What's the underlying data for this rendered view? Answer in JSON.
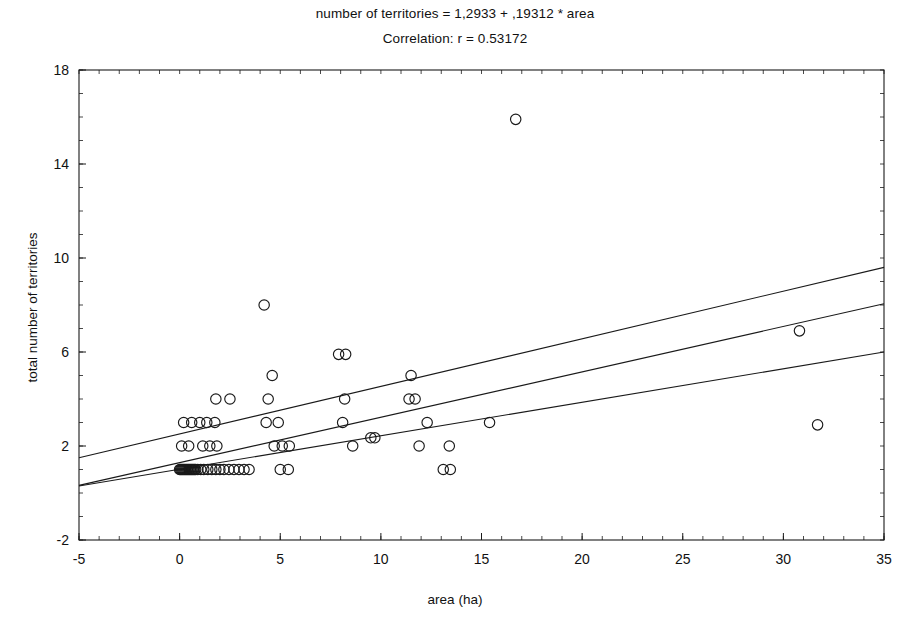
{
  "figure": {
    "title_equation": "number of territories = 1,2933 + ,19312 * area",
    "title_correlation": "Correlation: r = 0.53172",
    "xlabel": "area (ha)",
    "ylabel": "total number of territories",
    "background": "#ffffff",
    "ink_color": "#1a1a1a"
  },
  "chart_data": {
    "type": "scatter",
    "title": "number of territories = 1,2933 + ,19312 * area",
    "subtitle": "Correlation: r = 0.53172",
    "xlabel": "area (ha)",
    "ylabel": "total number of territories",
    "xlim": [
      -5,
      35
    ],
    "ylim": [
      -2,
      18
    ],
    "xticks": [
      -5,
      0,
      5,
      10,
      15,
      20,
      25,
      30,
      35
    ],
    "xticklabels": [
      "-5",
      "0",
      "5",
      "10",
      "15",
      "20",
      "25",
      "30",
      "35"
    ],
    "yticks": [
      -2,
      2,
      6,
      10,
      14,
      18
    ],
    "yticklabels": [
      "-2",
      "2",
      "6",
      "10",
      "14",
      "18"
    ],
    "x_minor_tick_step": 1,
    "y_minor_tick_step": 1,
    "grid": false,
    "legend": null,
    "marker": "open-circle",
    "regression": {
      "intercept": 1.2933,
      "slope": 0.19312,
      "r": 0.53172,
      "line_endpoints": [
        [
          -5,
          0.327
        ],
        [
          35,
          8.053
        ]
      ]
    },
    "confidence_bands": {
      "upper_endpoints": [
        [
          -5,
          1.5
        ],
        [
          35,
          9.6
        ]
      ],
      "lower_endpoints": [
        [
          -5,
          0.3
        ],
        [
          35,
          6.0
        ]
      ]
    },
    "points": [
      [
        0.05,
        1.0
      ],
      [
        0.15,
        1.0
      ],
      [
        0.25,
        1.0
      ],
      [
        0.35,
        1.0
      ],
      [
        0.45,
        1.0
      ],
      [
        0.6,
        1.0
      ],
      [
        0.75,
        1.0
      ],
      [
        0.9,
        1.0
      ],
      [
        1.05,
        1.0
      ],
      [
        1.2,
        1.0
      ],
      [
        1.4,
        1.0
      ],
      [
        1.6,
        1.0
      ],
      [
        1.8,
        1.0
      ],
      [
        2.0,
        1.0
      ],
      [
        2.2,
        1.0
      ],
      [
        2.45,
        1.0
      ],
      [
        2.7,
        1.0
      ],
      [
        2.95,
        1.0
      ],
      [
        3.2,
        1.0
      ],
      [
        3.45,
        1.0
      ],
      [
        0.0,
        1.0
      ],
      [
        0.1,
        1.0
      ],
      [
        0.2,
        1.0
      ],
      [
        0.3,
        1.0
      ],
      [
        0.4,
        1.0
      ],
      [
        0.5,
        1.0
      ],
      [
        0.55,
        1.0
      ],
      [
        0.65,
        1.0
      ],
      [
        0.7,
        1.0
      ],
      [
        0.8,
        1.0
      ],
      [
        5.0,
        1.0
      ],
      [
        5.4,
        1.0
      ],
      [
        0.1,
        2.0
      ],
      [
        0.45,
        2.0
      ],
      [
        1.15,
        2.0
      ],
      [
        1.5,
        2.0
      ],
      [
        1.85,
        2.0
      ],
      [
        4.7,
        2.0
      ],
      [
        5.1,
        2.0
      ],
      [
        5.45,
        2.0
      ],
      [
        8.6,
        2.0
      ],
      [
        9.5,
        2.35
      ],
      [
        9.7,
        2.35
      ],
      [
        11.9,
        2.0
      ],
      [
        13.1,
        1.0
      ],
      [
        13.45,
        1.0
      ],
      [
        13.4,
        2.0
      ],
      [
        0.2,
        3.0
      ],
      [
        0.6,
        3.0
      ],
      [
        1.0,
        3.0
      ],
      [
        1.35,
        3.0
      ],
      [
        1.75,
        3.0
      ],
      [
        4.3,
        3.0
      ],
      [
        4.9,
        3.0
      ],
      [
        8.1,
        3.0
      ],
      [
        12.3,
        3.0
      ],
      [
        15.4,
        3.0
      ],
      [
        31.7,
        2.9
      ],
      [
        1.8,
        4.0
      ],
      [
        2.5,
        4.0
      ],
      [
        4.4,
        4.0
      ],
      [
        8.2,
        4.0
      ],
      [
        11.4,
        4.0
      ],
      [
        11.7,
        4.0
      ],
      [
        4.6,
        5.0
      ],
      [
        11.5,
        5.0
      ],
      [
        7.9,
        5.9
      ],
      [
        8.25,
        5.9
      ],
      [
        30.8,
        6.9
      ],
      [
        4.2,
        8.0
      ],
      [
        16.7,
        15.9
      ]
    ]
  }
}
